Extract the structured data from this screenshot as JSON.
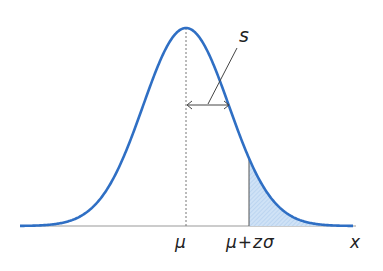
{
  "diagram": {
    "type": "normal-distribution",
    "colors": {
      "curve": "#2f6fc4",
      "fill": "#bcd8f2",
      "axis": "#888888",
      "line": "#333333"
    },
    "mean_x": 186,
    "sigma_px": 43,
    "peak_y": 28,
    "baseline_y": 226,
    "shaded_from_x": 249
  },
  "labels": {
    "s": "s",
    "mu": "μ",
    "mu_plus_z_sigma": "μ+zσ",
    "x": "x"
  }
}
